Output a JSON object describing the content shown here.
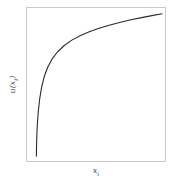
{
  "chart_data": {
    "type": "line",
    "title": "",
    "subtitle": "",
    "xlabel": "x i",
    "ylabel": "u(x i)",
    "xlabel_base": "x",
    "xlabel_sub": "i",
    "ylabel_base": "u(x",
    "ylabel_sub": "i",
    "ylabel_tail": ")",
    "legend": [],
    "legend_position": "none",
    "grid": false,
    "xticks": [],
    "yticks": [],
    "xlim": [
      0,
      1
    ],
    "ylim": [
      0,
      1
    ],
    "series": [
      {
        "name": "utility-curve",
        "color": "#2b2b2b",
        "line_width": 1.1,
        "description": "Concave increasing utility function, steeply rising near the left edge then flattening toward the upper right",
        "x": [
          0.068,
          0.069,
          0.071,
          0.075,
          0.082,
          0.092,
          0.106,
          0.125,
          0.15,
          0.182,
          0.222,
          0.27,
          0.325,
          0.388,
          0.456,
          0.528,
          0.602,
          0.678,
          0.754,
          0.83,
          0.905,
          0.978
        ],
        "y": [
          0.032,
          0.09,
          0.16,
          0.24,
          0.325,
          0.407,
          0.483,
          0.552,
          0.613,
          0.667,
          0.714,
          0.755,
          0.79,
          0.82,
          0.846,
          0.869,
          0.889,
          0.907,
          0.923,
          0.937,
          0.95,
          0.962
        ]
      }
    ]
  },
  "figure": {
    "background": "#ffffff",
    "frame_color": "#c9c9c9",
    "curve_color": "#2b2b2b",
    "label_color": "#4a4a4a"
  }
}
